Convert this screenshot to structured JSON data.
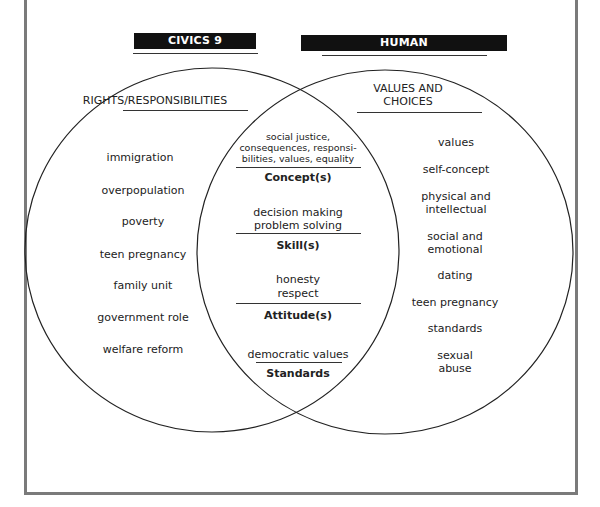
{
  "headers": {
    "left": "CIVICS 9",
    "right": "HUMAN GROWTH/DEVELOPMENT"
  },
  "left_circle": {
    "title": "RIGHTS/RESPONSIBILITIES",
    "items": [
      "immigration",
      "overpopulation",
      "poverty",
      "teen pregnancy",
      "family unit",
      "government role",
      "welfare reform"
    ]
  },
  "right_circle": {
    "title_line1": "VALUES AND",
    "title_line2": "CHOICES",
    "items": [
      "values",
      "self-concept",
      "physical and",
      "intellectual",
      "social and",
      "emotional",
      "dating",
      "teen pregnancy",
      "standards",
      "sexual",
      "abuse"
    ]
  },
  "overlap": {
    "concepts": [
      "social justice,",
      "consequences, responsi-",
      "bilities, values, equality"
    ],
    "concepts_label": "Concept(s)",
    "skills": [
      "decision making",
      "problem solving"
    ],
    "skills_label": "Skill(s)",
    "attitudes": [
      "honesty",
      "respect"
    ],
    "attitudes_label": "Attitude(s)",
    "standards": [
      "democratic values"
    ],
    "standards_label": "Standards"
  }
}
